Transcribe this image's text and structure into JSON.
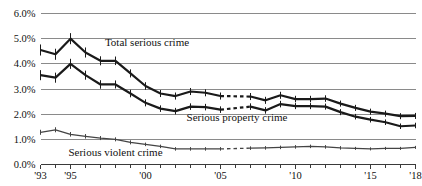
{
  "chart_data": {
    "type": "line",
    "title": "",
    "xlabel": "",
    "ylabel": "",
    "ylim": [
      0.0,
      6.0
    ],
    "xlim": [
      1993,
      2018
    ],
    "grid": true,
    "legend_position": "inline-annotations",
    "y_ticks": [
      "0.0%",
      "1.0%",
      "2.0%",
      "3.0%",
      "4.0%",
      "5.0%",
      "6.0%"
    ],
    "y_tick_values": [
      0.0,
      1.0,
      2.0,
      3.0,
      4.0,
      5.0,
      6.0
    ],
    "x_ticks_labeled": [
      "'93",
      "'95",
      "'00",
      "'05",
      "'10",
      "'15",
      "'18"
    ],
    "x_tick_values_labeled": [
      1993,
      1995,
      2000,
      2005,
      2010,
      2015,
      2018
    ],
    "x_ticks_all": [
      1993,
      1994,
      1995,
      1996,
      1997,
      1998,
      1999,
      2000,
      2001,
      2002,
      2003,
      2004,
      2005,
      2006,
      2007,
      2008,
      2009,
      2010,
      2011,
      2012,
      2013,
      2014,
      2015,
      2016,
      2017,
      2018
    ],
    "break_note": "series discontinuity between 2005 and 2007 (method change, shown as gap)",
    "series": [
      {
        "name": "Total serious crime",
        "label": "Total serious crime",
        "color": "#1a1a1a",
        "width": 2.2,
        "x": [
          1993,
          1994,
          1995,
          1996,
          1997,
          1998,
          1999,
          2000,
          2001,
          2002,
          2003,
          2004,
          2005,
          2007,
          2008,
          2009,
          2010,
          2011,
          2012,
          2013,
          2014,
          2015,
          2016,
          2017,
          2018
        ],
        "values": [
          4.55,
          4.38,
          5.0,
          4.45,
          4.12,
          4.12,
          3.62,
          3.12,
          2.82,
          2.72,
          2.9,
          2.85,
          2.72,
          2.7,
          2.55,
          2.75,
          2.6,
          2.6,
          2.62,
          2.42,
          2.25,
          2.1,
          2.02,
          1.92,
          1.93
        ],
        "err": [
          0.22,
          0.22,
          0.22,
          0.2,
          0.18,
          0.17,
          0.16,
          0.15,
          0.14,
          0.14,
          0.14,
          0.14,
          0.14,
          0.14,
          0.14,
          0.14,
          0.13,
          0.13,
          0.13,
          0.12,
          0.12,
          0.12,
          0.12,
          0.12,
          0.12
        ]
      },
      {
        "name": "Serious property crime",
        "label": "Serious property crime",
        "color": "#1a1a1a",
        "width": 2.2,
        "x": [
          1993,
          1994,
          1995,
          1996,
          1997,
          1998,
          1999,
          2000,
          2001,
          2002,
          2003,
          2004,
          2005,
          2007,
          2008,
          2009,
          2010,
          2011,
          2012,
          2013,
          2014,
          2015,
          2016,
          2017,
          2018
        ],
        "values": [
          3.55,
          3.45,
          4.0,
          3.55,
          3.18,
          3.18,
          2.82,
          2.45,
          2.22,
          2.12,
          2.3,
          2.28,
          2.18,
          2.3,
          2.15,
          2.4,
          2.32,
          2.32,
          2.3,
          2.08,
          1.9,
          1.78,
          1.68,
          1.52,
          1.55
        ],
        "err": [
          0.2,
          0.2,
          0.2,
          0.18,
          0.17,
          0.16,
          0.15,
          0.14,
          0.13,
          0.13,
          0.13,
          0.13,
          0.13,
          0.13,
          0.13,
          0.13,
          0.12,
          0.12,
          0.12,
          0.12,
          0.11,
          0.11,
          0.11,
          0.11,
          0.11
        ]
      },
      {
        "name": "Serious violent crime",
        "label": "Serious violent crime",
        "color": "#444444",
        "width": 1.3,
        "x": [
          1993,
          1994,
          1995,
          1996,
          1997,
          1998,
          1999,
          2000,
          2001,
          2002,
          2003,
          2004,
          2005,
          2007,
          2008,
          2009,
          2010,
          2011,
          2012,
          2013,
          2014,
          2015,
          2016,
          2017,
          2018
        ],
        "values": [
          1.28,
          1.38,
          1.2,
          1.12,
          1.05,
          1.0,
          0.88,
          0.8,
          0.72,
          0.62,
          0.62,
          0.62,
          0.62,
          0.65,
          0.66,
          0.68,
          0.7,
          0.72,
          0.7,
          0.66,
          0.64,
          0.62,
          0.64,
          0.64,
          0.68
        ],
        "err": [
          0.1,
          0.1,
          0.09,
          0.09,
          0.08,
          0.08,
          0.08,
          0.07,
          0.07,
          0.07,
          0.07,
          0.07,
          0.07,
          0.07,
          0.07,
          0.07,
          0.07,
          0.07,
          0.07,
          0.07,
          0.06,
          0.06,
          0.06,
          0.06,
          0.06
        ]
      }
    ],
    "annotations": [
      {
        "text": "Total serious crime",
        "x": 2000.1,
        "y": 4.7,
        "name": "total-serious-crime-label"
      },
      {
        "text": "Serious property crime",
        "x": 2006.1,
        "y": 1.72,
        "name": "serious-property-crime-label"
      },
      {
        "text": "Serious violent crime",
        "x": 1998.0,
        "y": 0.33,
        "name": "serious-violent-crime-label"
      }
    ]
  }
}
